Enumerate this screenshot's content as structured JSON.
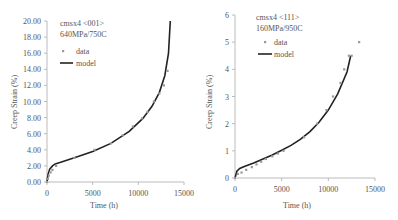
{
  "chart_data": [
    {
      "type": "scatter",
      "title": "cmsx4 <001>",
      "subtitle": "640MPa/750C",
      "xlabel": "Time (h)",
      "ylabel": "Creep Strain (%)",
      "xlim": [
        0,
        15000
      ],
      "ylim": [
        0,
        20
      ],
      "xticks": [
        "0",
        "5000",
        "10000",
        "15000"
      ],
      "yticks": [
        "0.00",
        "2.00",
        "4.00",
        "6.00",
        "8.00",
        "10.00",
        "12.00",
        "14.00",
        "16.00",
        "18.00",
        "20.00"
      ],
      "grid": false,
      "legend": {
        "position": "upper-left",
        "entries": [
          "data",
          "model"
        ]
      },
      "series": [
        {
          "name": "data",
          "kind": "points",
          "x": [
            0,
            100,
            200,
            400,
            600,
            1000,
            3000,
            5200,
            7000,
            8300,
            9400,
            10400,
            11000,
            11700,
            12300,
            12800,
            13200
          ],
          "y": [
            0.0,
            0.4,
            0.8,
            1.2,
            1.5,
            2.0,
            3.0,
            4.0,
            4.8,
            5.8,
            6.9,
            7.9,
            8.7,
            10.0,
            11.0,
            12.0,
            13.8
          ]
        },
        {
          "name": "model",
          "kind": "line",
          "x": [
            0,
            100,
            300,
            600,
            900,
            1500,
            3000,
            5000,
            7000,
            9000,
            10500,
            11500,
            12300,
            12900,
            13300,
            13500
          ],
          "y": [
            0.0,
            0.9,
            1.6,
            2.0,
            2.25,
            2.45,
            3.0,
            3.8,
            4.8,
            6.3,
            7.9,
            9.4,
            11.1,
            13.2,
            16.0,
            20.0
          ]
        }
      ]
    },
    {
      "type": "scatter",
      "title": "cmsx4 <111>",
      "subtitle": "160MPa/950C",
      "xlabel": "Time (h)",
      "ylabel": "Creep Strain (%)",
      "xlim": [
        0,
        15000
      ],
      "ylim": [
        0,
        6
      ],
      "xticks": [
        "0",
        "5000",
        "10000",
        "15000"
      ],
      "yticks": [
        "0",
        "1",
        "2",
        "3",
        "4",
        "5",
        "6"
      ],
      "grid": false,
      "legend": {
        "position": "upper-left",
        "entries": [
          "data",
          "model"
        ]
      },
      "series": [
        {
          "name": "data",
          "kind": "points",
          "x": [
            0,
            300,
            700,
            1200,
            1800,
            2300,
            2800,
            3300,
            4000,
            4600,
            5200,
            7400,
            8800,
            9800,
            10500,
            11300,
            11700,
            12200,
            12500,
            13300
          ],
          "y": [
            0.0,
            0.15,
            0.2,
            0.3,
            0.4,
            0.5,
            0.6,
            0.7,
            0.8,
            0.9,
            1.0,
            1.5,
            2.0,
            2.5,
            3.0,
            3.5,
            4.0,
            4.5,
            4.5,
            5.0
          ]
        },
        {
          "name": "model",
          "kind": "line",
          "x": [
            0,
            200,
            500,
            1000,
            2000,
            3000,
            4000,
            5000,
            6000,
            7000,
            8000,
            9000,
            10000,
            11000,
            12000,
            12400
          ],
          "y": [
            0.0,
            0.25,
            0.35,
            0.42,
            0.55,
            0.7,
            0.85,
            1.02,
            1.2,
            1.42,
            1.7,
            2.05,
            2.5,
            3.1,
            3.9,
            4.5
          ]
        }
      ]
    }
  ]
}
